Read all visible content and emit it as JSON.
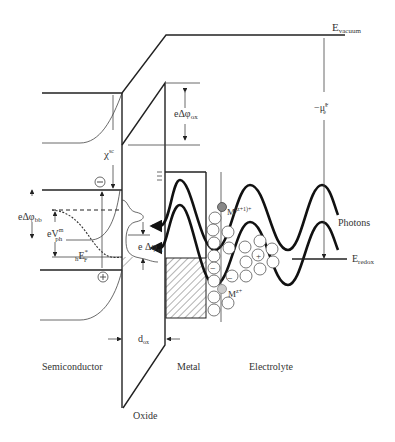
{
  "diagram": {
    "type": "energy band diagram",
    "labels": {
      "e_vacuum": "E",
      "e_vacuum_sub": "vacuum",
      "mu_e": "−μ̃",
      "mu_e_sup": "s",
      "mu_e_sub": "e",
      "e_delta_phi_ox": "eΔφ",
      "e_delta_phi_ox_sub": "ox",
      "chi": "χ",
      "chi_sup": "sc",
      "e_delta_phi_bb": "eΔφ",
      "e_delta_phi_bb_sub": "bb",
      "e_v_ph": "eV",
      "e_v_ph_sup": "m",
      "e_v_ph_sub": "ph",
      "h_ef": "E",
      "h_ef_pre": "h",
      "h_ef_sup": "*",
      "h_ef_sub": "F",
      "e_delta_phi_ss": "e Δφ",
      "e_delta_phi_ss_sub": "ss",
      "m_z1": "M",
      "m_z1_sup": "(z+1)+",
      "m_z": "M",
      "m_z_sup": "z+",
      "photons": "Photons",
      "e_redox": "E",
      "e_redox_sub": "redox",
      "d_ox": "d",
      "d_ox_sub": "ox",
      "minus_sign": "−",
      "plus_sign": "+"
    },
    "regions": {
      "semiconductor": "Semiconductor",
      "metal": "Metal",
      "electrolyte": "Electrolyte",
      "oxide": "Oxide"
    }
  }
}
